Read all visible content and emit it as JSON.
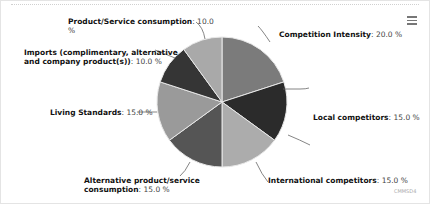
{
  "chart_data": {
    "type": "pie",
    "title": "",
    "slices": [
      {
        "name": "Competition Intensity",
        "value": 20.0,
        "color": "#7b7b7b"
      },
      {
        "name": "Local competitors",
        "value": 15.0,
        "color": "#2b2b2b"
      },
      {
        "name": "International competitors",
        "value": 15.0,
        "color": "#acacac"
      },
      {
        "name": "Alternative product/service consumption",
        "value": 15.0,
        "color": "#555555"
      },
      {
        "name": "Living Standards",
        "value": 15.0,
        "color": "#9a9a9a"
      },
      {
        "name": "Imports (complimentary, alternative and company product(s))",
        "value": 10.0,
        "color": "#353535"
      },
      {
        "name": "Product/Service consumption",
        "value": 10.0,
        "color": "#a9a9a9"
      }
    ],
    "value_suffix": " %",
    "legend": false
  },
  "labels": {
    "competition": {
      "name": "Competition Intensity",
      "value": ": 20.0 %"
    },
    "local": {
      "name": "Local competitors",
      "value": ": 15.0 %"
    },
    "international": {
      "name": "International competitors",
      "value": ": 15.0 %"
    },
    "alternative": {
      "line1": "Alternative product/service",
      "name2": "consumption",
      "value": ": 15.0 %"
    },
    "living": {
      "name": "Living Standards",
      "value": ": 15.0 %"
    },
    "imports": {
      "line1": "Imports (complimentary, alternative",
      "name2": "and company product(s))",
      "value": ": 10.0 %"
    },
    "product": {
      "name": "Product/Service consumption",
      "value": ": 10.0",
      "wrap": "%"
    }
  },
  "menu": {
    "icon": "hamburger-menu-icon"
  },
  "credit": "CMMSD4"
}
